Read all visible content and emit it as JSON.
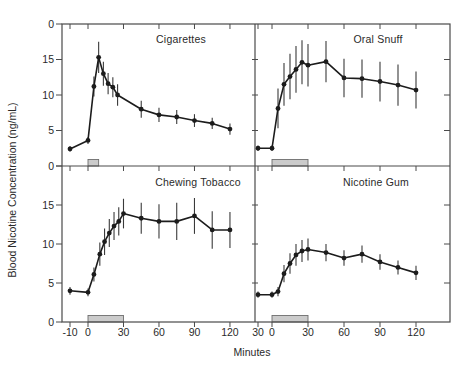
{
  "figure": {
    "y_axis_label": "Blood Nicotine Concentration (ng/mL)",
    "x_axis_label": "Minutes"
  },
  "colors": {
    "line": "#1c1c1c",
    "error_bar": "#3a3a3a",
    "frame": "#4a4a4a",
    "bar_fill": "#cbcbcb",
    "bar_stroke": "#6e6e6e",
    "text": "#2a2a2a"
  },
  "axes": {
    "x_tick_minutes": [
      -10,
      0,
      30,
      60,
      90,
      120
    ],
    "x_tick_labels": {
      "left": [
        "-10",
        "0",
        "30",
        "60",
        "90",
        "120"
      ],
      "right": [
        "30",
        "0",
        "30",
        "60",
        "90",
        "120"
      ]
    },
    "y_tick_values": [
      0,
      5,
      10,
      15,
      20
    ],
    "y_tick_labels": {
      "top": [
        "0",
        "5",
        "10",
        "15",
        "0"
      ],
      "bottom": [
        "0",
        "5",
        "10",
        "15",
        ""
      ]
    },
    "ylim": [
      0,
      20
    ],
    "xlim": [
      -10,
      133
    ]
  },
  "chart_data": [
    {
      "type": "line",
      "title": "Cigarettes",
      "position": "top-left",
      "x_minutes": [
        -10,
        0,
        5,
        9,
        13,
        17,
        21,
        25,
        45,
        60,
        75,
        90,
        105,
        120
      ],
      "y_ng_ml": [
        2.4,
        3.6,
        11.2,
        15.3,
        13.0,
        11.6,
        11.1,
        10.0,
        8.0,
        7.2,
        6.9,
        6.4,
        6.0,
        5.2
      ],
      "err_ng_ml": [
        0.4,
        0.5,
        1.4,
        2.2,
        1.7,
        1.5,
        1.4,
        1.5,
        1.2,
        1.0,
        1.0,
        0.9,
        0.8,
        0.8
      ],
      "exposure_bar_minutes": {
        "start": 0,
        "end": 9
      }
    },
    {
      "type": "line",
      "title": "Oral Snuff",
      "position": "top-right",
      "x_minutes": [
        -10,
        0,
        5,
        10,
        15,
        20,
        25,
        30,
        45,
        60,
        75,
        90,
        105,
        120
      ],
      "y_ng_ml": [
        2.5,
        2.5,
        8.1,
        11.5,
        12.6,
        13.6,
        14.6,
        14.2,
        14.7,
        12.4,
        12.3,
        11.9,
        11.4,
        10.7
      ],
      "err_ng_ml": [
        0.4,
        0.4,
        2.8,
        3.0,
        3.2,
        3.3,
        3.1,
        3.0,
        2.9,
        2.7,
        2.7,
        2.8,
        2.9,
        2.6
      ],
      "exposure_bar_minutes": {
        "start": 0,
        "end": 30
      }
    },
    {
      "type": "line",
      "title": "Chewing Tobacco",
      "position": "bottom-left",
      "x_minutes": [
        -10,
        0,
        5,
        10,
        14,
        18,
        22,
        26,
        30,
        45,
        60,
        75,
        90,
        105,
        120
      ],
      "y_ng_ml": [
        4.0,
        3.8,
        6.1,
        8.7,
        10.3,
        11.4,
        12.3,
        12.9,
        13.9,
        13.3,
        12.9,
        12.9,
        13.6,
        11.8,
        11.8
      ],
      "err_ng_ml": [
        0.5,
        0.5,
        0.9,
        1.5,
        1.7,
        1.8,
        1.8,
        1.8,
        1.9,
        2.0,
        2.2,
        2.4,
        2.3,
        2.4,
        2.3
      ],
      "exposure_bar_minutes": {
        "start": 0,
        "end": 30
      }
    },
    {
      "type": "line",
      "title": "Nicotine Gum",
      "position": "bottom-right",
      "x_minutes": [
        -10,
        0,
        5,
        10,
        15,
        20,
        25,
        30,
        45,
        60,
        75,
        90,
        105,
        120
      ],
      "y_ng_ml": [
        3.5,
        3.5,
        3.9,
        6.2,
        7.5,
        8.6,
        9.1,
        9.3,
        8.9,
        8.2,
        8.7,
        7.7,
        7.0,
        6.3
      ],
      "err_ng_ml": [
        0.4,
        0.4,
        0.6,
        1.1,
        1.3,
        1.4,
        1.4,
        1.4,
        1.1,
        1.0,
        1.1,
        1.0,
        0.9,
        0.9
      ],
      "exposure_bar_minutes": {
        "start": 0,
        "end": 30
      }
    }
  ]
}
